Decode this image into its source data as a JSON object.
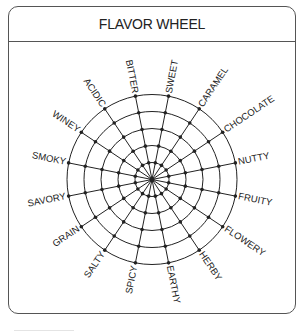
{
  "header": {
    "title": "FLAVOR WHEEL"
  },
  "wheel": {
    "center": [
      152,
      179.5
    ],
    "ring_radii": [
      17,
      34,
      51,
      68,
      85
    ],
    "start_angle_deg": 11.25,
    "step_deg": 22.5,
    "line_color": "#222222",
    "labels": [
      "SWEET",
      "CARAMEL",
      "CHOCOLATE",
      "NUTTY",
      "FRUITY",
      "FLOWERY",
      "HERBY",
      "EARTHY",
      "SPICY",
      "SALTY",
      "GRAIN",
      "SAVORY",
      "SMOKY",
      "WINEY",
      "ACIDIC",
      "BITTER"
    ]
  }
}
